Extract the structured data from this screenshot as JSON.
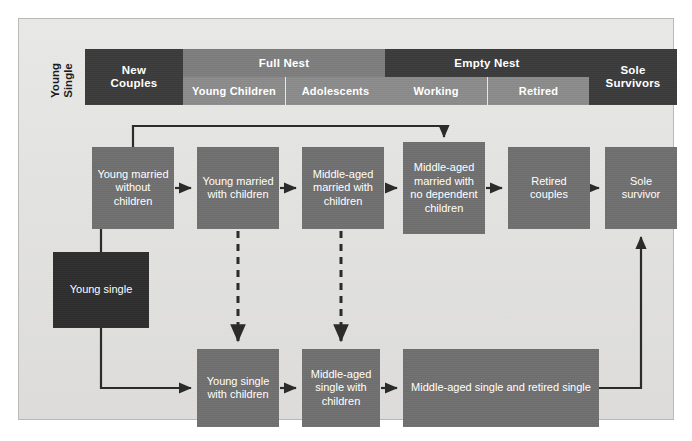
{
  "diagram": {
    "side_label": {
      "line1": "Young",
      "line2": "Single"
    },
    "colors": {
      "panel_bg": "#e6e6e4",
      "panel_border": "#b9b9b6",
      "header_dark": "#3b3b3b",
      "header_mid": "#7d7d7d",
      "header_light": "#8b8b8b",
      "box_gray": "#6f6f6f",
      "box_black": "#2e2e2e",
      "arrow": "#2b2b2b",
      "text_on_dark": "#ffffff"
    }
  },
  "header": {
    "stages": [
      {
        "id": "new-couples",
        "label": "New\nCouples",
        "tone": "dark",
        "span": 1
      },
      {
        "id": "full-nest",
        "label": "Full Nest",
        "tone": "mid",
        "span": 2
      },
      {
        "id": "empty-nest",
        "label": "Empty Nest",
        "tone": "dark",
        "span": 2
      },
      {
        "id": "sole-survivors",
        "label": "Sole\nSurvivors",
        "tone": "dark",
        "span": 1
      }
    ],
    "substages": [
      {
        "id": "young-children",
        "label": "Young Children",
        "parent": "full-nest"
      },
      {
        "id": "adolescents",
        "label": "Adolescents",
        "parent": "full-nest"
      },
      {
        "id": "working",
        "label": "Working",
        "parent": "empty-nest"
      },
      {
        "id": "retired",
        "label": "Retired",
        "parent": "empty-nest"
      }
    ],
    "new_couples_line1": "New",
    "new_couples_line2": "Couples",
    "full_nest": "Full Nest",
    "young_children": "Young Children",
    "adolescents": "Adolescents",
    "empty_nest": "Empty Nest",
    "working": "Working",
    "retired": "Retired",
    "sole_survivors_line1": "Sole",
    "sole_survivors_line2": "Survivors"
  },
  "nodes": {
    "young_married_without_children": "Young married without children",
    "young_married_with_children": "Young married with children",
    "middle_aged_married_with_children": "Middle-aged married with children",
    "middle_aged_married_no_dependent_children": "Middle-aged married with no dependent children",
    "retired_couples": "Retired couples",
    "sole_survivor": "Sole survivor",
    "young_single": "Young single",
    "young_single_with_children": "Young single with children",
    "middle_aged_single_with_children": "Middle-aged single with children",
    "middle_aged_single_and_retired_single": "Middle-aged single and retired single"
  },
  "edges": [
    {
      "from": "young_single",
      "to": "young_married_without_children",
      "style": "solid"
    },
    {
      "from": "young_married_without_children",
      "to": "young_married_with_children",
      "style": "solid"
    },
    {
      "from": "young_married_with_children",
      "to": "middle_aged_married_with_children",
      "style": "solid"
    },
    {
      "from": "middle_aged_married_with_children",
      "to": "middle_aged_married_no_dependent_children",
      "style": "solid"
    },
    {
      "from": "middle_aged_married_no_dependent_children",
      "to": "retired_couples",
      "style": "solid"
    },
    {
      "from": "retired_couples",
      "to": "sole_survivor",
      "style": "solid"
    },
    {
      "from": "young_married_without_children",
      "to": "middle_aged_married_no_dependent_children",
      "style": "solid-bypass"
    },
    {
      "from": "young_married_with_children",
      "to": "young_single_with_children",
      "style": "dashed"
    },
    {
      "from": "middle_aged_married_with_children",
      "to": "middle_aged_single_with_children",
      "style": "dashed"
    },
    {
      "from": "young_single",
      "to": "young_single_with_children",
      "style": "solid"
    },
    {
      "from": "young_single_with_children",
      "to": "middle_aged_single_with_children",
      "style": "solid"
    },
    {
      "from": "middle_aged_single_with_children",
      "to": "middle_aged_single_and_retired_single",
      "style": "solid"
    },
    {
      "from": "middle_aged_single_and_retired_single",
      "to": "sole_survivor",
      "style": "solid-return"
    }
  ]
}
